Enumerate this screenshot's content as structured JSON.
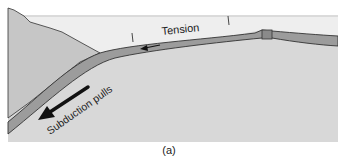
{
  "figure": {
    "caption": "(a)",
    "labels": {
      "tension": "Tension",
      "subduction_pulls": "Subduction pulls"
    },
    "colors": {
      "sea": "#eeeeee",
      "mantle": "#d8d8d8",
      "overriding_wedge": "#c6c6c6",
      "plate": "#9c9c9c",
      "outline": "#333333",
      "arrow": "#111111",
      "background": "#ffffff"
    },
    "elements": [
      {
        "name": "overriding-plate-wedge",
        "description": "continental wedge on left"
      },
      {
        "name": "subducting-plate",
        "description": "oceanic plate bending down into mantle"
      },
      {
        "name": "spreading-ridge",
        "description": "notched ridge segment on right"
      },
      {
        "name": "tension-tick-marks",
        "count": 2
      },
      {
        "name": "tension-arrow",
        "direction": "left"
      },
      {
        "name": "subduction-pull-arrow",
        "direction": "down-left"
      }
    ]
  }
}
